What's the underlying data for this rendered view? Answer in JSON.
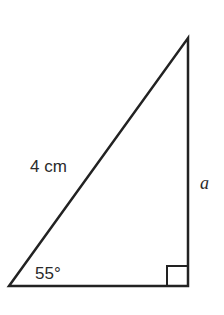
{
  "diagram": {
    "type": "right-triangle",
    "vertices": {
      "bottom_left": [
        9,
        286
      ],
      "top_right": [
        188,
        38
      ],
      "bottom_right": [
        188,
        286
      ]
    },
    "labels": {
      "hypotenuse": "4 cm",
      "opposite_side": "a",
      "angle": "55°"
    },
    "right_angle_marker": true,
    "stroke_color": "#222222"
  }
}
